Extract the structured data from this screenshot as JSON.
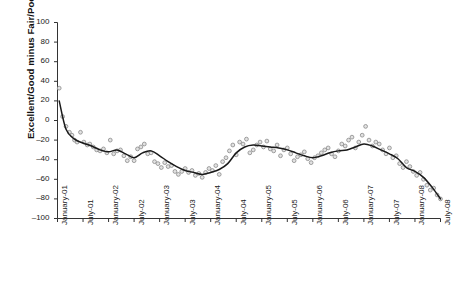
{
  "figure": {
    "title": "Figure 3  Public Perceptions of the Economy, 2001-2008",
    "title_visible": false
  },
  "axes": {
    "ylabel": "Excellent/Good minus Fair/Poor",
    "xlabel": "",
    "y_ticks": [
      "100",
      "80",
      "60",
      "40",
      "20",
      "0",
      "–20",
      "–40",
      "–60",
      "–80",
      "–100"
    ],
    "x_ticks": [
      "January-01",
      "July-01",
      "January-02",
      "July-02",
      "January-03",
      "July-03",
      "January-04",
      "July-04",
      "January-05",
      "July-05",
      "January-06",
      "July-06",
      "January-07",
      "July-07",
      "January-08",
      "July-08"
    ]
  },
  "colors": {
    "marker_stroke": "#8a8a8a",
    "marker_fill": "#e2e2e2",
    "trend_line": "#1a1a1a",
    "axis": "#333333",
    "text": "#222222"
  },
  "chart_data": {
    "type": "scatter",
    "title": "",
    "xlabel": "",
    "ylabel": "Excellent/Good minus Fair/Poor",
    "xlim": [
      0,
      90
    ],
    "ylim": [
      -100,
      100
    ],
    "grid": false,
    "legend": "none",
    "x_tick_values": [
      0,
      6,
      12,
      18,
      24,
      30,
      36,
      42,
      48,
      54,
      60,
      66,
      72,
      78,
      84,
      90
    ],
    "x_tick_labels": [
      "January-01",
      "July-01",
      "January-02",
      "July-02",
      "January-03",
      "July-03",
      "January-04",
      "July-04",
      "January-05",
      "July-05",
      "January-06",
      "July-06",
      "January-07",
      "July-07",
      "January-08",
      "July-08"
    ],
    "y_tick_values": [
      100,
      80,
      60,
      40,
      20,
      0,
      -20,
      -40,
      -60,
      -80,
      -100
    ],
    "series": [
      {
        "name": "Survey observations",
        "type": "scatter",
        "marker": "open-circle",
        "x": [
          0.4,
          1.2,
          2.0,
          2.8,
          3.4,
          4.0,
          4.6,
          5.4,
          6.2,
          7.0,
          7.6,
          8.4,
          9.2,
          10.0,
          10.8,
          11.6,
          12.4,
          13.2,
          14.0,
          14.8,
          15.6,
          16.4,
          17.2,
          18.0,
          18.8,
          19.6,
          20.4,
          21.2,
          22.0,
          22.8,
          23.6,
          24.4,
          25.2,
          26.0,
          26.8,
          27.6,
          28.4,
          29.2,
          30.0,
          30.8,
          31.6,
          32.4,
          33.2,
          34.0,
          34.8,
          35.6,
          36.4,
          37.2,
          38.0,
          38.8,
          39.6,
          40.4,
          41.2,
          42.0,
          42.8,
          43.6,
          44.4,
          45.2,
          46.0,
          46.8,
          47.6,
          48.4,
          49.2,
          50.0,
          50.8,
          51.6,
          52.4,
          53.2,
          54.0,
          54.8,
          55.6,
          56.4,
          57.2,
          58.0,
          58.8,
          59.6,
          60.4,
          61.2,
          62.0,
          62.8,
          63.6,
          64.4,
          65.2,
          66.0,
          66.8,
          67.6,
          68.4,
          69.2,
          70.0,
          70.8,
          71.6,
          72.4,
          73.2,
          74.0,
          74.8,
          75.6,
          76.4,
          77.2,
          78.0,
          78.8,
          79.6,
          80.4,
          81.2,
          82.0,
          82.8,
          83.6,
          84.4,
          85.2,
          86.0,
          86.8,
          87.6,
          88.4,
          89.2,
          90.0
        ],
        "y": [
          33,
          4,
          -6,
          -12,
          -15,
          -20,
          -22,
          -12,
          -22,
          -25,
          -24,
          -27,
          -30,
          -31,
          -29,
          -33,
          -20,
          -34,
          -31,
          -30,
          -36,
          -41,
          -37,
          -41,
          -29,
          -27,
          -24,
          -34,
          -33,
          -42,
          -44,
          -48,
          -43,
          -47,
          -46,
          -52,
          -55,
          -52,
          -49,
          -53,
          -51,
          -56,
          -54,
          -58,
          -53,
          -49,
          -51,
          -46,
          -55,
          -42,
          -38,
          -31,
          -25,
          -35,
          -22,
          -24,
          -19,
          -33,
          -30,
          -25,
          -22,
          -27,
          -21,
          -29,
          -31,
          -25,
          -36,
          -30,
          -28,
          -34,
          -41,
          -37,
          -35,
          -32,
          -39,
          -43,
          -38,
          -36,
          -33,
          -30,
          -28,
          -34,
          -37,
          -31,
          -24,
          -26,
          -20,
          -17,
          -28,
          -22,
          -15,
          -6,
          -20,
          -26,
          -22,
          -24,
          -30,
          -34,
          -28,
          -38,
          -36,
          -44,
          -48,
          -42,
          -47,
          -52,
          -56,
          -53,
          -60,
          -66,
          -71,
          -69,
          -76,
          -80
        ]
      },
      {
        "name": "Smoothed trend",
        "type": "line",
        "x": [
          0.4,
          2,
          4,
          6,
          8,
          10,
          12,
          14,
          16,
          18,
          20,
          22,
          24,
          26,
          28,
          30,
          32,
          34,
          36,
          38,
          40,
          42,
          44,
          46,
          48,
          50,
          52,
          54,
          56,
          58,
          60,
          62,
          64,
          66,
          68,
          70,
          72,
          74,
          76,
          78,
          80,
          82,
          84,
          86,
          88,
          90
        ],
        "y": [
          20,
          -9,
          -19,
          -23,
          -26,
          -30,
          -32,
          -30,
          -34,
          -38,
          -33,
          -31,
          -36,
          -42,
          -47,
          -51,
          -53,
          -55,
          -53,
          -50,
          -44,
          -33,
          -27,
          -25,
          -26,
          -27,
          -28,
          -30,
          -33,
          -36,
          -38,
          -36,
          -33,
          -31,
          -30,
          -27,
          -24,
          -26,
          -30,
          -34,
          -39,
          -48,
          -52,
          -58,
          -68,
          -80
        ]
      }
    ]
  }
}
